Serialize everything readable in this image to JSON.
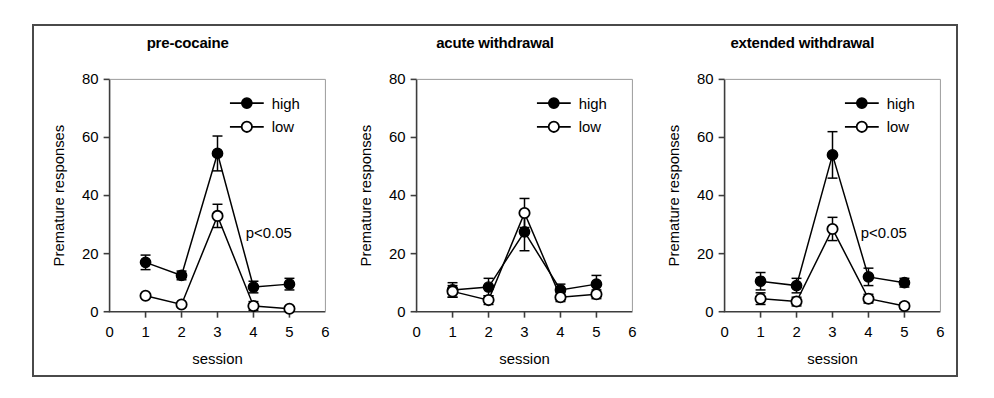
{
  "figure": {
    "border_color": "#4a4a4a",
    "background": "#ffffff"
  },
  "chart_data": [
    {
      "type": "line",
      "title": "pre-cocaine",
      "xlabel": "session",
      "ylabel": "Premature responses",
      "xlim": [
        0,
        6
      ],
      "ylim": [
        0,
        80
      ],
      "xticks": [
        0,
        1,
        2,
        3,
        4,
        5,
        6
      ],
      "yticks": [
        0,
        20,
        40,
        60,
        80
      ],
      "grid": false,
      "legend_position": "top-right",
      "annotation": "p<0.05",
      "x": [
        1,
        2,
        3,
        4,
        5
      ],
      "series": [
        {
          "name": "high",
          "marker": "filled-circle",
          "values": [
            17,
            12.5,
            54.5,
            8.5,
            9.5
          ],
          "errors": [
            2.5,
            1.5,
            6,
            2,
            2
          ]
        },
        {
          "name": "low",
          "marker": "open-circle",
          "values": [
            5.5,
            2.5,
            33,
            2,
            1
          ],
          "errors": [
            0,
            0,
            4,
            1.5,
            0.8
          ]
        }
      ]
    },
    {
      "type": "line",
      "title": "acute withdrawal",
      "xlabel": "session",
      "ylabel": "Premature responses",
      "xlim": [
        0,
        6
      ],
      "ylim": [
        0,
        80
      ],
      "xticks": [
        0,
        1,
        2,
        3,
        4,
        5,
        6
      ],
      "yticks": [
        0,
        20,
        40,
        60,
        80
      ],
      "grid": false,
      "legend_position": "top-right",
      "annotation": "",
      "x": [
        1,
        2,
        3,
        4,
        5
      ],
      "series": [
        {
          "name": "high",
          "marker": "filled-circle",
          "values": [
            7.5,
            8.5,
            27.5,
            7.5,
            9.5
          ],
          "errors": [
            2.5,
            3,
            6.5,
            2,
            3
          ]
        },
        {
          "name": "low",
          "marker": "open-circle",
          "values": [
            7,
            4,
            34,
            5,
            6
          ],
          "errors": [
            2,
            1.5,
            5,
            1.5,
            1.5
          ]
        }
      ]
    },
    {
      "type": "line",
      "title": "extended withdrawal",
      "xlabel": "session",
      "ylabel": "Premature responses",
      "xlim": [
        0,
        6
      ],
      "ylim": [
        0,
        80
      ],
      "xticks": [
        0,
        1,
        2,
        3,
        4,
        5,
        6
      ],
      "yticks": [
        0,
        20,
        40,
        60,
        80
      ],
      "grid": false,
      "legend_position": "top-right",
      "annotation": "p<0.05",
      "x": [
        1,
        2,
        3,
        4,
        5
      ],
      "series": [
        {
          "name": "high",
          "marker": "filled-circle",
          "values": [
            10.5,
            9,
            54,
            12,
            10
          ],
          "errors": [
            3,
            2.5,
            8,
            3,
            1.5
          ]
        },
        {
          "name": "low",
          "marker": "open-circle",
          "values": [
            4.5,
            3.5,
            28.5,
            4.5,
            2
          ],
          "errors": [
            2,
            1.5,
            4,
            1.5,
            1
          ]
        }
      ]
    }
  ]
}
